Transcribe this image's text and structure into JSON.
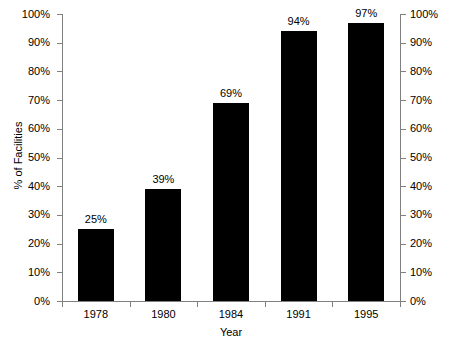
{
  "chart_data": {
    "type": "bar",
    "title": "",
    "categories": [
      "1978",
      "1980",
      "1984",
      "1991",
      "1995"
    ],
    "values": [
      25,
      39,
      69,
      94,
      97
    ],
    "data_labels": [
      "25%",
      "39%",
      "69%",
      "94%",
      "97%"
    ],
    "xlabel": "Year",
    "ylabel": "% of Facilities",
    "ylim": [
      0,
      100
    ],
    "ytick_values": [
      0,
      10,
      20,
      30,
      40,
      50,
      60,
      70,
      80,
      90,
      100
    ],
    "ytick_labels": [
      "0%",
      "10%",
      "20%",
      "30%",
      "40%",
      "50%",
      "60%",
      "70%",
      "80%",
      "90%",
      "100%"
    ],
    "ytick_labels_right": [
      "0%",
      "10%",
      "20%",
      "30%",
      "40%",
      "50%",
      "60%",
      "70%",
      "80%",
      "90%",
      "100%"
    ],
    "grid": false,
    "legend": false,
    "bar_color": "#000000",
    "axis_color": "#808080",
    "text_color": "#000000",
    "background_color": "#ffffff",
    "dual_y_axis": true
  }
}
